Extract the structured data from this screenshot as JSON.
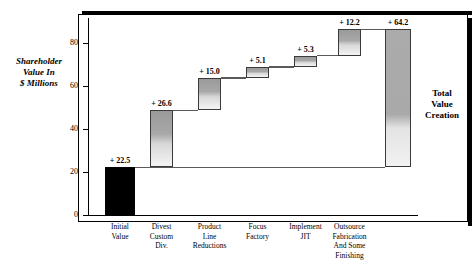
{
  "chart_data": {
    "type": "bar",
    "subtype": "waterfall",
    "title": "",
    "xlabel": "",
    "ylabel": "Shareholder Value In $ Millions",
    "ylim": [
      0,
      92
    ],
    "yticks": [
      0,
      20,
      40,
      60,
      80
    ],
    "ytick_labels": [
      "0",
      "20",
      "40",
      "60",
      "80"
    ],
    "grid": false,
    "legend": null,
    "annotations": [
      {
        "name": "total-value-creation",
        "text": "Total\nValue\nCreation"
      }
    ],
    "categories": [
      "Initial\nValue",
      "Divest\nCustom\nDiv.",
      "Product\nLine\nReductions",
      "Focus\nFactory",
      "Implement\nJIT",
      "Outsource\nFabrication\nAnd Some\nFinishing",
      ""
    ],
    "bars": [
      {
        "label": "Initial\nValue",
        "value_label": "+ 22.5",
        "value": 22.5,
        "base": 0.0,
        "top": 22.5,
        "kind": "initial"
      },
      {
        "label": "Divest\nCustom\nDiv.",
        "value_label": "+ 26.6",
        "value": 26.6,
        "base": 22.5,
        "top": 49.1,
        "kind": "step"
      },
      {
        "label": "Product\nLine\nReductions",
        "value_label": "+ 15.0",
        "value": 15.0,
        "base": 49.1,
        "top": 64.1,
        "kind": "step"
      },
      {
        "label": "Focus\nFactory",
        "value_label": "+ 5.1",
        "value": 5.1,
        "base": 64.1,
        "top": 69.2,
        "kind": "step"
      },
      {
        "label": "Implement\nJIT",
        "value_label": "+ 5.3",
        "value": 5.3,
        "base": 69.2,
        "top": 74.5,
        "kind": "step"
      },
      {
        "label": "Outsource\nFabrication\nAnd Some\nFinishing",
        "value_label": "+ 12.2",
        "value": 12.2,
        "base": 74.5,
        "top": 86.7,
        "kind": "step"
      },
      {
        "label": "",
        "value_label": "+ 64.2",
        "value": 64.2,
        "base": 22.5,
        "top": 86.7,
        "kind": "total"
      }
    ]
  },
  "axis": {
    "y_title_lines": [
      "Shareholder",
      "Value In",
      "$ Millions"
    ]
  },
  "colors": {
    "initial_bar": "#000000",
    "step_bar_top": "#9a9a9a",
    "step_bar_bottom": "#f4f4f4",
    "total_bar": "#ababab",
    "frame": "#000000",
    "connector": "#5a5a5a"
  }
}
